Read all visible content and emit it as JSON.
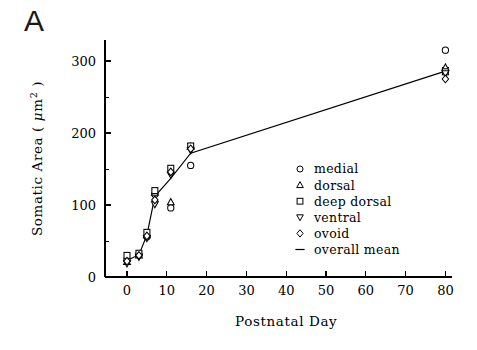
{
  "figure": {
    "panel_letter": "A"
  },
  "chart_data": {
    "type": "scatter",
    "title": "A",
    "xlabel": "Postnatal Day",
    "ylabel": "Somatic Area ( μm2)",
    "ylabel_parts": {
      "pre": "Somatic Area ( ",
      "mu": "μ",
      "unit": "m",
      "exponent": "2",
      "post": " )"
    },
    "xlim": [
      -4,
      84
    ],
    "ylim": [
      0,
      330
    ],
    "xticks": [
      0,
      10,
      20,
      30,
      40,
      50,
      60,
      70,
      80
    ],
    "xticklabels": [
      "0",
      "10",
      "20",
      "30",
      "40",
      "50",
      "60",
      "70",
      "80"
    ],
    "yticks": [
      0,
      100,
      200,
      300
    ],
    "yticklabels": [
      "0",
      "100",
      "200",
      "300"
    ],
    "yminorticks": [
      50,
      150,
      250
    ],
    "grid": false,
    "legend_position": "center-right",
    "legend": [
      {
        "label": "medial",
        "marker": "circle"
      },
      {
        "label": "dorsal",
        "marker": "triangle-up"
      },
      {
        "label": "deep dorsal",
        "marker": "square"
      },
      {
        "label": "ventral",
        "marker": "triangle-down"
      },
      {
        "label": "ovoid",
        "marker": "diamond"
      },
      {
        "label": "overall mean",
        "marker": "line"
      }
    ],
    "series": [
      {
        "name": "medial",
        "marker": "circle",
        "points": [
          {
            "x": 0,
            "y": 24
          },
          {
            "x": 3,
            "y": 31
          },
          {
            "x": 5,
            "y": 56
          },
          {
            "x": 7,
            "y": 115
          },
          {
            "x": 11,
            "y": 96
          },
          {
            "x": 16,
            "y": 155
          },
          {
            "x": 80,
            "y": 315
          }
        ]
      },
      {
        "name": "dorsal",
        "marker": "triangle-up",
        "points": [
          {
            "x": 0,
            "y": 21
          },
          {
            "x": 3,
            "y": 30
          },
          {
            "x": 5,
            "y": 58
          },
          {
            "x": 7,
            "y": 117
          },
          {
            "x": 11,
            "y": 104
          },
          {
            "x": 16,
            "y": 181
          },
          {
            "x": 80,
            "y": 291
          }
        ]
      },
      {
        "name": "deep dorsal",
        "marker": "square",
        "points": [
          {
            "x": 0,
            "y": 30
          },
          {
            "x": 3,
            "y": 33
          },
          {
            "x": 5,
            "y": 62
          },
          {
            "x": 7,
            "y": 120
          },
          {
            "x": 11,
            "y": 151
          },
          {
            "x": 16,
            "y": 182
          },
          {
            "x": 80,
            "y": 285
          }
        ]
      },
      {
        "name": "ventral",
        "marker": "triangle-down",
        "points": [
          {
            "x": 0,
            "y": 19
          },
          {
            "x": 3,
            "y": 28
          },
          {
            "x": 5,
            "y": 54
          },
          {
            "x": 7,
            "y": 101
          },
          {
            "x": 11,
            "y": 142
          },
          {
            "x": 16,
            "y": 176
          },
          {
            "x": 80,
            "y": 283
          }
        ]
      },
      {
        "name": "ovoid",
        "marker": "diamond",
        "points": [
          {
            "x": 0,
            "y": 22
          },
          {
            "x": 3,
            "y": 30
          },
          {
            "x": 5,
            "y": 57
          },
          {
            "x": 7,
            "y": 107
          },
          {
            "x": 11,
            "y": 146
          },
          {
            "x": 16,
            "y": 178
          },
          {
            "x": 80,
            "y": 275
          }
        ]
      },
      {
        "name": "overall mean",
        "marker": "line",
        "points": [
          {
            "x": 0,
            "y": 23
          },
          {
            "x": 3,
            "y": 31
          },
          {
            "x": 5,
            "y": 58
          },
          {
            "x": 7,
            "y": 112
          },
          {
            "x": 11,
            "y": 137
          },
          {
            "x": 16,
            "y": 172
          },
          {
            "x": 80,
            "y": 286
          }
        ]
      }
    ],
    "errorbars": [
      {
        "x": 16,
        "y": 181,
        "err": 4
      },
      {
        "x": 80,
        "y": 288,
        "err": 3
      }
    ]
  }
}
